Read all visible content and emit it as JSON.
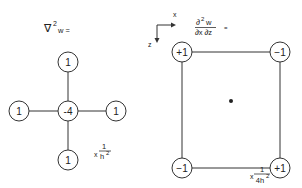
{
  "laplacian_stencil": {
    "label_operator": "∇",
    "label_exp": "2",
    "label_var": "w =",
    "center": "-4",
    "top": "1",
    "bottom": "1",
    "left": "1",
    "right": "1",
    "scale_prefix": "x",
    "scale_num": "1",
    "scale_den": "h",
    "scale_den_exp": "2"
  },
  "mixed_derivative_stencil": {
    "numerator": "∂",
    "numerator_exp": "2",
    "numerator_var": "w",
    "denominator": "∂x ∂z",
    "equals": "=",
    "top_left": "+1",
    "top_right": "−1",
    "bottom_left": "−1",
    "bottom_right": "+1",
    "scale_prefix": "x",
    "scale_num": "1",
    "scale_den": "4h",
    "scale_den_exp": "2"
  },
  "axes": {
    "x_label": "x",
    "z_label": "z"
  },
  "colors": {
    "line": "#333333",
    "background": "#ffffff"
  }
}
